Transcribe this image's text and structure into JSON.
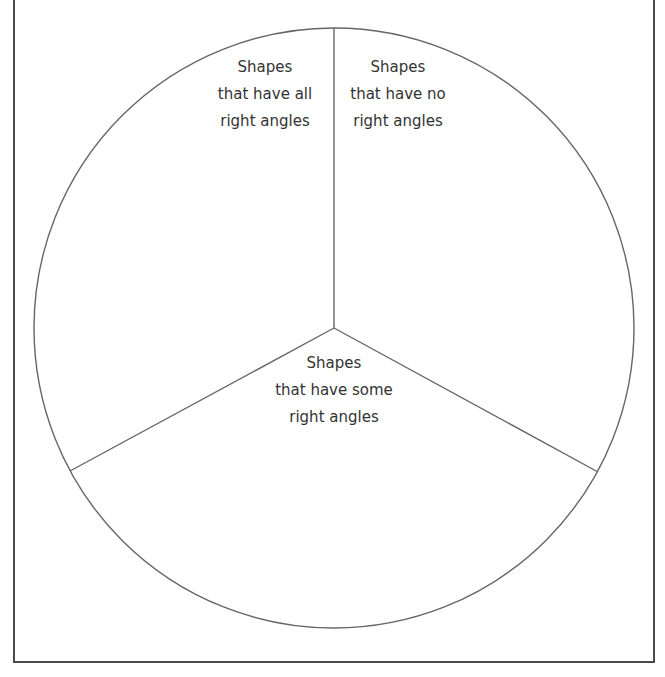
{
  "title_partial": "...g...g...",
  "diagram": {
    "type": "three-section circle (Carroll-style sorting wheel)",
    "circle": {
      "cx": 334,
      "cy": 328,
      "r": 300
    },
    "line_color": "#666666",
    "frame_color": "#4a4a4a",
    "sections": [
      {
        "id": "all",
        "lines": [
          "Shapes",
          "that have all",
          "right angles"
        ]
      },
      {
        "id": "none",
        "lines": [
          "Shapes",
          "that have no",
          "right angles"
        ]
      },
      {
        "id": "some",
        "lines": [
          "Shapes",
          "that have some",
          "right angles"
        ]
      }
    ]
  }
}
